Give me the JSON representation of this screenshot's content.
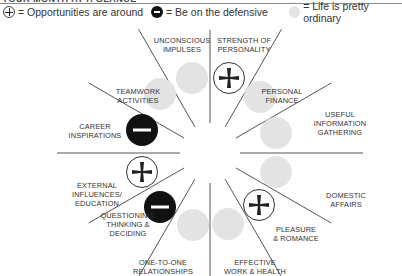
{
  "header": {
    "title": "YOUR MONTH AT A GLANCE"
  },
  "legend": [
    {
      "icon": "plus-circle-icon",
      "label": "= Opportunities are around"
    },
    {
      "icon": "minus-circle-icon",
      "label": "= Be on the defensive"
    },
    {
      "icon": "gray-circle-icon",
      "label": "= Life is pretty ordinary"
    }
  ],
  "colors": {
    "line": "#555555",
    "gray_circle": "#e3e3e3",
    "black_circle": "#111111",
    "text": "#333333"
  },
  "wheel": {
    "center": [
      210,
      153
    ],
    "segments": [
      {
        "label_lines": [
          "STRENGTH OF",
          "PERSONALITY"
        ],
        "status": "opportunity"
      },
      {
        "label_lines": [
          "PERSONAL",
          "FINANCE"
        ],
        "status": "ordinary"
      },
      {
        "label_lines": [
          "USEFUL",
          "INFORMATION",
          "GATHERING"
        ],
        "status": "ordinary"
      },
      {
        "label_lines": [
          "DOMESTIC",
          "AFFAIRS"
        ],
        "status": "ordinary"
      },
      {
        "label_lines": [
          "PLEASURE",
          "& ROMANCE"
        ],
        "status": "opportunity"
      },
      {
        "label_lines": [
          "EFFECTIVE",
          "WORK & HEALTH"
        ],
        "status": "ordinary"
      },
      {
        "label_lines": [
          "ONE-TO-ONE",
          "RELATIONSHIPS"
        ],
        "status": "ordinary"
      },
      {
        "label_lines": [
          "QUESTIONING,",
          "THINKING &",
          "DECIDING"
        ],
        "status": "defensive"
      },
      {
        "label_lines": [
          "EXTERNAL",
          "INFLUENCES/",
          "EDUCATION"
        ],
        "status": "opportunity"
      },
      {
        "label_lines": [
          "CAREER",
          "INSPIRATIONS"
        ],
        "status": "defensive"
      },
      {
        "label_lines": [
          "TEAMWORK",
          "ACTIVITIES"
        ],
        "status": "ordinary"
      },
      {
        "label_lines": [
          "UNCONSCIOUS",
          "IMPULSES"
        ],
        "status": "ordinary"
      }
    ]
  }
}
